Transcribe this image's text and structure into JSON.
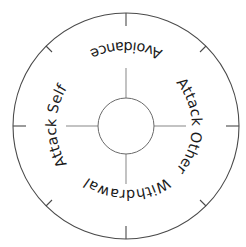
{
  "diagram": {
    "type": "circular-quadrant-wheel",
    "colors": {
      "background": "#ffffff",
      "outer_ring": "#4a4a4a",
      "ticks": "#4a4a4a",
      "inner_circle": "#6a6a6a",
      "cross_lines": "#9a9a9a",
      "text": "#1a1a1a"
    },
    "labels": {
      "top": "Avoidance",
      "right": "Attack Other",
      "bottom": "Withdrawal",
      "left": "Attack Self"
    },
    "center": {
      "x": 126,
      "y": 126
    },
    "outer_radius": 113,
    "inner_radius": 28,
    "tick_count": 8
  }
}
